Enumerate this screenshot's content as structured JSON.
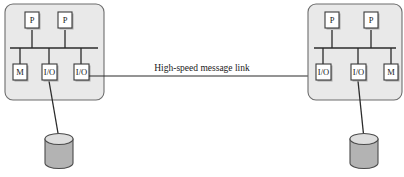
{
  "diagram": {
    "link_label": "High-speed message link",
    "left_node": {
      "name": "left-cluster-node",
      "processors": [
        {
          "label": "P",
          "x": 25,
          "y": 12
        },
        {
          "label": "P",
          "x": 58,
          "y": 12
        }
      ],
      "devices": [
        {
          "label": "M",
          "x": 13,
          "y": 64
        },
        {
          "label": "I/O",
          "x": 42,
          "y": 64
        },
        {
          "label": "I/O",
          "x": 74,
          "y": 64
        }
      ],
      "panel": {
        "x": 5,
        "y": 4,
        "w": 99,
        "h": 96
      },
      "bus": {
        "x1": 10,
        "x2": 98,
        "y": 48
      },
      "disk": {
        "cx": 59,
        "top": 139,
        "rx": 14,
        "ry": 5.5,
        "h": 24
      }
    },
    "right_node": {
      "name": "right-cluster-node",
      "processors": [
        {
          "label": "P",
          "x": 325,
          "y": 12
        },
        {
          "label": "P",
          "x": 364,
          "y": 12
        }
      ],
      "devices": [
        {
          "label": "I/O",
          "x": 316,
          "y": 64
        },
        {
          "label": "I/O",
          "x": 351,
          "y": 64
        },
        {
          "label": "M",
          "x": 384,
          "y": 64
        }
      ],
      "panel": {
        "x": 308,
        "y": 4,
        "w": 94,
        "h": 96
      },
      "bus": {
        "x1": 314,
        "x2": 396,
        "y": 48
      },
      "disk": {
        "cx": 364,
        "top": 139,
        "rx": 14,
        "ry": 5.5,
        "h": 24
      }
    },
    "link": {
      "x1": 95,
      "x2": 316,
      "y": 76
    },
    "colors": {
      "panel_fill": "#e9e9e9",
      "panel_stroke": "#6d6d6d",
      "box_fill": "#ffffff",
      "box_stroke": "#3a3a3a",
      "wire": "#2b2b2b",
      "disk_body": "#b3b3b3",
      "disk_top": "#dedede",
      "background": "#ffffff"
    }
  }
}
